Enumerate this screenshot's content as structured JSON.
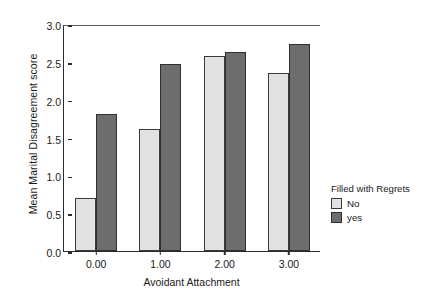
{
  "chart_data": {
    "type": "bar",
    "title": "",
    "xlabel": "Avoidant Attachment",
    "ylabel": "Mean Marital Disagreement score",
    "categories": [
      "0.00",
      "1.00",
      "2.00",
      "3.00"
    ],
    "series": [
      {
        "name": "No",
        "color": "#e2e2e2",
        "values": [
          0.7,
          1.61,
          2.58,
          2.35
        ]
      },
      {
        "name": "yes",
        "color": "#6d6d6d",
        "values": [
          1.81,
          2.47,
          2.63,
          2.74
        ]
      }
    ],
    "ylim": [
      0.0,
      3.0
    ],
    "yticks": [
      "0.0",
      "0.5",
      "1.0",
      "1.5",
      "2.0",
      "2.5",
      "3.0"
    ],
    "ytick_values": [
      0.0,
      0.5,
      1.0,
      1.5,
      2.0,
      2.5,
      3.0
    ],
    "grid": false,
    "legend_position": "right",
    "legend_title": "Filled with Regrets"
  },
  "legend": {
    "title": "Filled with Regrets",
    "entries": [
      {
        "label": "No"
      },
      {
        "label": "yes"
      }
    ]
  },
  "axes": {
    "y_title": "Mean Marital Disagreement score",
    "x_title": "Avoidant Attachment"
  }
}
